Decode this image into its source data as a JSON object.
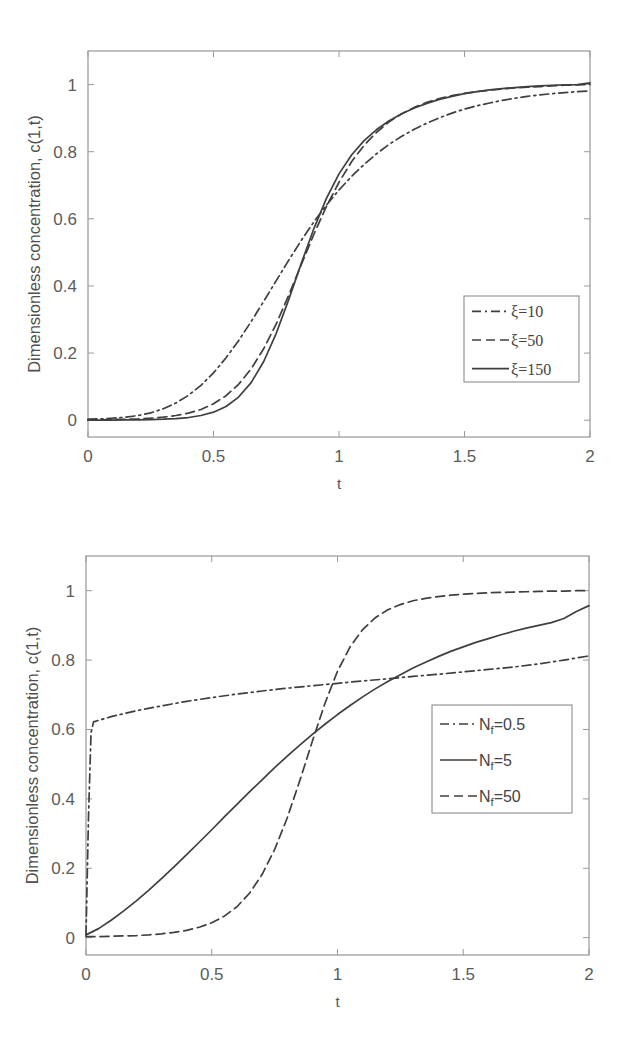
{
  "figure": {
    "background": "#ffffff",
    "line_color": "#3f3f3f",
    "axis_color": "#8d8d8d",
    "text_color": "#4f4f4f"
  },
  "chart_data": [
    {
      "id": "panel-top",
      "type": "line",
      "title": "",
      "xlabel": "t",
      "ylabel": "Dimensionless concentration, c(1,t)",
      "xlim": [
        0,
        2
      ],
      "ylim": [
        -0.05,
        1.1
      ],
      "xticks": [
        0,
        0.5,
        1,
        1.5,
        2
      ],
      "xticklabels": [
        "0",
        "0.5",
        "1",
        "1.5",
        "2"
      ],
      "yticks": [
        0,
        0.2,
        0.4,
        0.6,
        0.8,
        1
      ],
      "yticklabels": [
        "0",
        "0.2",
        "0.4",
        "0.6",
        "0.8",
        "1"
      ],
      "grid": false,
      "legend_position": "lower right",
      "series": [
        {
          "name": "ξ=10",
          "style": "dashdot",
          "x": [
            0,
            0.05,
            0.1,
            0.15,
            0.2,
            0.25,
            0.3,
            0.35,
            0.4,
            0.45,
            0.5,
            0.55,
            0.6,
            0.65,
            0.7,
            0.75,
            0.8,
            0.85,
            0.9,
            0.95,
            1.0,
            1.05,
            1.1,
            1.15,
            1.2,
            1.25,
            1.3,
            1.35,
            1.4,
            1.45,
            1.5,
            1.55,
            1.6,
            1.65,
            1.7,
            1.75,
            1.8,
            1.85,
            1.9,
            1.95,
            2.0
          ],
          "y": [
            0.003,
            0.004,
            0.006,
            0.009,
            0.014,
            0.022,
            0.034,
            0.051,
            0.074,
            0.104,
            0.141,
            0.186,
            0.237,
            0.294,
            0.354,
            0.416,
            0.477,
            0.536,
            0.591,
            0.641,
            0.686,
            0.726,
            0.762,
            0.794,
            0.822,
            0.846,
            0.867,
            0.885,
            0.901,
            0.915,
            0.927,
            0.937,
            0.945,
            0.953,
            0.959,
            0.965,
            0.969,
            0.973,
            0.976,
            0.979,
            0.981
          ]
        },
        {
          "name": "ξ=50",
          "style": "dashed",
          "x": [
            0,
            0.05,
            0.1,
            0.15,
            0.2,
            0.25,
            0.3,
            0.35,
            0.4,
            0.45,
            0.5,
            0.55,
            0.6,
            0.65,
            0.7,
            0.75,
            0.8,
            0.85,
            0.9,
            0.95,
            1.0,
            1.05,
            1.1,
            1.15,
            1.2,
            1.25,
            1.3,
            1.35,
            1.4,
            1.45,
            1.5,
            1.55,
            1.6,
            1.65,
            1.7,
            1.75,
            1.8,
            1.85,
            1.9,
            1.95,
            2.0
          ],
          "y": [
            0.001,
            0.001,
            0.002,
            0.003,
            0.004,
            0.006,
            0.009,
            0.014,
            0.021,
            0.032,
            0.049,
            0.073,
            0.107,
            0.153,
            0.213,
            0.287,
            0.373,
            0.464,
            0.554,
            0.637,
            0.709,
            0.77,
            0.819,
            0.858,
            0.889,
            0.913,
            0.932,
            0.947,
            0.958,
            0.967,
            0.974,
            0.979,
            0.983,
            0.987,
            0.99,
            0.992,
            0.994,
            0.996,
            0.998,
            0.999,
            1.0
          ]
        },
        {
          "name": "ξ=150",
          "style": "solid",
          "x": [
            0,
            0.05,
            0.1,
            0.15,
            0.2,
            0.25,
            0.3,
            0.35,
            0.4,
            0.45,
            0.5,
            0.55,
            0.6,
            0.65,
            0.7,
            0.75,
            0.8,
            0.85,
            0.9,
            0.95,
            1.0,
            1.05,
            1.1,
            1.15,
            1.2,
            1.25,
            1.3,
            1.35,
            1.4,
            1.45,
            1.5,
            1.55,
            1.6,
            1.65,
            1.7,
            1.75,
            1.8,
            1.85,
            1.9,
            1.95,
            2.0
          ],
          "y": [
            0.0,
            0.0,
            0.0,
            0.001,
            0.001,
            0.002,
            0.003,
            0.005,
            0.008,
            0.014,
            0.024,
            0.041,
            0.069,
            0.112,
            0.175,
            0.259,
            0.36,
            0.468,
            0.571,
            0.661,
            0.734,
            0.79,
            0.833,
            0.866,
            0.892,
            0.913,
            0.93,
            0.944,
            0.956,
            0.965,
            0.973,
            0.979,
            0.984,
            0.988,
            0.991,
            0.994,
            0.996,
            0.998,
            0.999,
            1.0,
            1.005
          ]
        }
      ]
    },
    {
      "id": "panel-bottom",
      "type": "line",
      "title": "",
      "xlabel": "t",
      "ylabel": "Dimensionless concentration, c(1,t)",
      "xlim": [
        0,
        2
      ],
      "ylim": [
        -0.05,
        1.1
      ],
      "xticks": [
        0,
        0.5,
        1,
        1.5,
        2
      ],
      "xticklabels": [
        "0",
        "0.5",
        "1",
        "1.5",
        "2"
      ],
      "yticks": [
        0,
        0.2,
        0.4,
        0.6,
        0.8,
        1
      ],
      "yticklabels": [
        "0",
        "0.2",
        "0.4",
        "0.6",
        "0.8",
        "1"
      ],
      "grid": false,
      "legend_position": "center right",
      "series": [
        {
          "name": "N_f=0.5",
          "label_base": "N",
          "label_sub": "f",
          "label_tail": "=0.5",
          "style": "dashdot",
          "x": [
            0,
            0.01,
            0.02,
            0.03,
            0.1,
            0.2,
            0.3,
            0.4,
            0.5,
            0.6,
            0.7,
            0.8,
            0.9,
            1.0,
            1.1,
            1.2,
            1.3,
            1.4,
            1.5,
            1.6,
            1.7,
            1.8,
            1.9,
            2.0
          ],
          "y": [
            0.008,
            0.35,
            0.59,
            0.622,
            0.637,
            0.654,
            0.668,
            0.681,
            0.692,
            0.702,
            0.711,
            0.719,
            0.726,
            0.733,
            0.74,
            0.746,
            0.753,
            0.759,
            0.766,
            0.773,
            0.78,
            0.789,
            0.8,
            0.812
          ]
        },
        {
          "name": "N_f=5",
          "label_base": "N",
          "label_sub": "f",
          "label_tail": "=5",
          "style": "solid",
          "x": [
            0,
            0.05,
            0.1,
            0.15,
            0.2,
            0.25,
            0.3,
            0.35,
            0.4,
            0.45,
            0.5,
            0.55,
            0.6,
            0.65,
            0.7,
            0.75,
            0.8,
            0.85,
            0.9,
            0.95,
            1.0,
            1.05,
            1.1,
            1.15,
            1.2,
            1.25,
            1.3,
            1.35,
            1.4,
            1.45,
            1.5,
            1.55,
            1.6,
            1.65,
            1.7,
            1.75,
            1.8,
            1.85,
            1.9,
            1.95,
            2.0
          ],
          "y": [
            0.008,
            0.026,
            0.05,
            0.077,
            0.106,
            0.137,
            0.17,
            0.204,
            0.239,
            0.275,
            0.311,
            0.348,
            0.384,
            0.42,
            0.455,
            0.49,
            0.523,
            0.555,
            0.586,
            0.615,
            0.643,
            0.669,
            0.694,
            0.717,
            0.738,
            0.758,
            0.777,
            0.794,
            0.81,
            0.825,
            0.838,
            0.851,
            0.862,
            0.873,
            0.883,
            0.892,
            0.9,
            0.908,
            0.92,
            0.94,
            0.957
          ]
        },
        {
          "name": "N_f=50",
          "label_base": "N",
          "label_sub": "f",
          "label_tail": "=50",
          "style": "dashed",
          "x": [
            0,
            0.05,
            0.1,
            0.15,
            0.2,
            0.25,
            0.3,
            0.35,
            0.4,
            0.45,
            0.5,
            0.55,
            0.6,
            0.65,
            0.7,
            0.75,
            0.8,
            0.85,
            0.9,
            0.95,
            1.0,
            1.05,
            1.1,
            1.15,
            1.2,
            1.25,
            1.3,
            1.35,
            1.4,
            1.45,
            1.5,
            1.55,
            1.6,
            1.65,
            1.7,
            1.75,
            1.8,
            1.85,
            1.9,
            1.95,
            2.0
          ],
          "y": [
            0.003,
            0.003,
            0.004,
            0.005,
            0.006,
            0.008,
            0.011,
            0.015,
            0.021,
            0.03,
            0.043,
            0.062,
            0.089,
            0.128,
            0.182,
            0.254,
            0.345,
            0.452,
            0.566,
            0.675,
            0.768,
            0.838,
            0.888,
            0.922,
            0.945,
            0.96,
            0.971,
            0.978,
            0.983,
            0.987,
            0.99,
            0.992,
            0.994,
            0.995,
            0.996,
            0.997,
            0.998,
            0.999,
            0.999,
            1.0,
            1.0
          ]
        }
      ]
    }
  ]
}
